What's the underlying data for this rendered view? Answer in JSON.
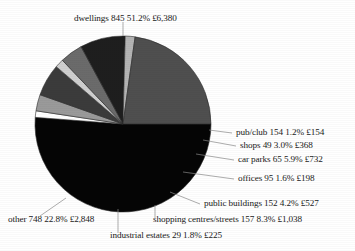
{
  "chart_data": {
    "type": "pie",
    "title": "",
    "legend": "labels-with-leader-lines",
    "grid": false,
    "categories": [
      "dwellings",
      "pub/club",
      "shops",
      "car parks",
      "offices",
      "public buildings",
      "shopping centres/streets",
      "industrial estates",
      "other"
    ],
    "values": [
      51.2,
      1.2,
      3.0,
      5.9,
      1.6,
      4.2,
      8.3,
      1.8,
      22.8
    ],
    "counts": [
      845,
      154,
      49,
      65,
      95,
      152,
      157,
      29,
      748
    ],
    "amounts": [
      "£6,380",
      "£154",
      "£368",
      "£732",
      "£198",
      "£527",
      "£1,038",
      "£225",
      "£2,848"
    ],
    "colors": [
      "#050505",
      "#ffffff",
      "#9a9a9a",
      "#3b3b3b",
      "#cfcfcf",
      "#6b6b6b",
      "#1e1e1e",
      "#b4b4b4",
      "#4f4f4f"
    ],
    "slices": [
      {
        "name": "dwellings",
        "count": 845,
        "percent": "51.2%",
        "amount": "£6,380",
        "value": 51.2,
        "color": "#050505"
      },
      {
        "name": "pub/club",
        "count": 154,
        "percent": "1.2%",
        "amount": "£154",
        "value": 1.2,
        "color": "#ffffff"
      },
      {
        "name": "shops",
        "count": 49,
        "percent": "3.0%",
        "amount": "£368",
        "value": 3.0,
        "color": "#9a9a9a"
      },
      {
        "name": "car parks",
        "count": 65,
        "percent": "5.9%",
        "amount": "£732",
        "value": 5.9,
        "color": "#3b3b3b"
      },
      {
        "name": "offices",
        "count": 95,
        "percent": "1.6%",
        "amount": "£198",
        "value": 1.6,
        "color": "#cfcfcf"
      },
      {
        "name": "public buildings",
        "count": 152,
        "percent": "4.2%",
        "amount": "£527",
        "value": 4.2,
        "color": "#6b6b6b"
      },
      {
        "name": "shopping centres/streets",
        "count": 157,
        "percent": "8.3%",
        "amount": "£1,038",
        "value": 8.3,
        "color": "#1e1e1e"
      },
      {
        "name": "industrial estates",
        "count": 29,
        "percent": "1.8%",
        "amount": "£225",
        "value": 1.8,
        "color": "#b4b4b4"
      },
      {
        "name": "other",
        "count": 748,
        "percent": "22.8%",
        "amount": "£2,848",
        "value": 22.8,
        "color": "#4f4f4f"
      }
    ]
  },
  "labels": {
    "dwellings": "dwellings 845 51.2% £6,380",
    "pub_club": "pub/club 154 1.2% £154",
    "shops": "shops 49 3.0% £368",
    "car_parks": "car parks 65 5.9% £732",
    "offices": "offices 95 1.6% £198",
    "public_buildings": "public buildings 152 4.2% £527",
    "shopping_centres": "shopping centres/streets 157 8.3% £1,038",
    "industrial_estates": "industrial estates 29 1.8% £225",
    "other": "other 748 22.8% £2,848"
  }
}
